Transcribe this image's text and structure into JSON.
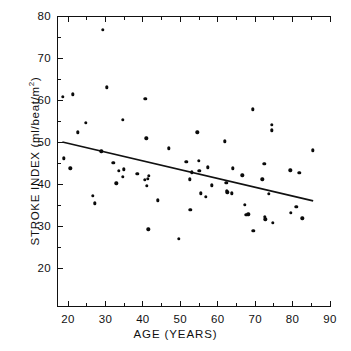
{
  "chart_data": {
    "type": "scatter",
    "title": "",
    "xlabel": "AGE  (YEARS)",
    "ylabel": "STROKE INDEX  (ml/beat/m",
    "ylabel_sup": "2",
    "ylabel_close": ")",
    "xlim": [
      16,
      90
    ],
    "ylim": [
      10.7,
      80
    ],
    "xticks": [
      20,
      30,
      40,
      50,
      60,
      70,
      80,
      90
    ],
    "yticks": [
      20,
      30,
      40,
      50,
      60,
      70,
      80
    ],
    "xtick_labels": [
      "20",
      "30",
      "40",
      "50",
      "60",
      "70",
      "80",
      "90"
    ],
    "ytick_labels": [
      "20",
      "30",
      "40",
      "50",
      "60",
      "70",
      "80"
    ],
    "xminor_step": 5,
    "yminor_step": 5,
    "grid": false,
    "legend": null,
    "marker": "filled-circle",
    "marker_color": "#0a0a0a",
    "line_color": "#111111",
    "trendline": {
      "type": "linear-regression",
      "x_start": 18.5,
      "y_start": 50.0,
      "x_end": 85.5,
      "y_end": 36.0
    },
    "points": [
      [
        18.6,
        60.8
      ],
      [
        18.9,
        46.1
      ],
      [
        20.6,
        43.7
      ],
      [
        21.3,
        61.4
      ],
      [
        22.6,
        52.3
      ],
      [
        24.8,
        54.5
      ],
      [
        26.7,
        37.2
      ],
      [
        27.2,
        35.4
      ],
      [
        28.9,
        47.8
      ],
      [
        29.3,
        76.7
      ],
      [
        30.4,
        63.0
      ],
      [
        32.1,
        45.0
      ],
      [
        32.9,
        40.2
      ],
      [
        33.6,
        43.2
      ],
      [
        34.6,
        41.7
      ],
      [
        34.9,
        43.5
      ],
      [
        34.6,
        55.3
      ],
      [
        38.5,
        42.4
      ],
      [
        40.6,
        41.0
      ],
      [
        40.7,
        60.3
      ],
      [
        40.9,
        50.9
      ],
      [
        41.1,
        39.6
      ],
      [
        41.6,
        41.9
      ],
      [
        41.4,
        41.2
      ],
      [
        41.5,
        29.2
      ],
      [
        44.0,
        36.1
      ],
      [
        47.0,
        48.5
      ],
      [
        49.6,
        27.0
      ],
      [
        51.6,
        45.3
      ],
      [
        52.5,
        41.1
      ],
      [
        52.7,
        33.9
      ],
      [
        53.1,
        42.8
      ],
      [
        54.5,
        52.3
      ],
      [
        54.9,
        45.5
      ],
      [
        55.1,
        43.1
      ],
      [
        55.5,
        37.8
      ],
      [
        56.8,
        36.9
      ],
      [
        57.3,
        44.0
      ],
      [
        58.4,
        39.7
      ],
      [
        61.9,
        50.2
      ],
      [
        62.3,
        40.3
      ],
      [
        62.5,
        38.4
      ],
      [
        62.6,
        38.0
      ],
      [
        63.8,
        37.8
      ],
      [
        64.0,
        43.7
      ],
      [
        66.6,
        42.1
      ],
      [
        67.3,
        35.0
      ],
      [
        67.6,
        32.6
      ],
      [
        68.2,
        32.8
      ],
      [
        69.3,
        57.8
      ],
      [
        69.5,
        28.9
      ],
      [
        71.9,
        41.1
      ],
      [
        72.4,
        44.8
      ],
      [
        72.6,
        32.2
      ],
      [
        72.7,
        31.6
      ],
      [
        73.7,
        37.6
      ],
      [
        74.4,
        54.1
      ],
      [
        74.5,
        52.8
      ],
      [
        74.8,
        30.8
      ],
      [
        79.4,
        43.3
      ],
      [
        79.6,
        33.2
      ],
      [
        81.0,
        34.6
      ],
      [
        81.8,
        42.6
      ],
      [
        82.6,
        31.8
      ],
      [
        85.4,
        48.0
      ]
    ]
  }
}
